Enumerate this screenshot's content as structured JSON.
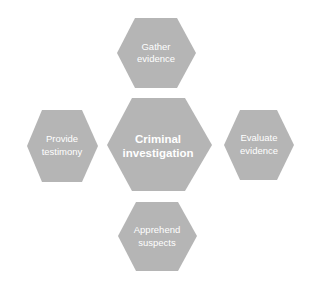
{
  "diagram": {
    "type": "hexagon-hub",
    "fill_color": "#b5b5b5",
    "text_color": "#ffffff",
    "center": {
      "lines": [
        "Criminal",
        "investigation"
      ]
    },
    "nodes": [
      {
        "position": "top",
        "lines": [
          "Gather",
          "evidence"
        ]
      },
      {
        "position": "right",
        "lines": [
          "Evaluate",
          "evidence"
        ]
      },
      {
        "position": "bottom",
        "lines": [
          "Apprehend",
          "suspects"
        ]
      },
      {
        "position": "left",
        "lines": [
          "Provide",
          "testimony"
        ]
      }
    ]
  }
}
